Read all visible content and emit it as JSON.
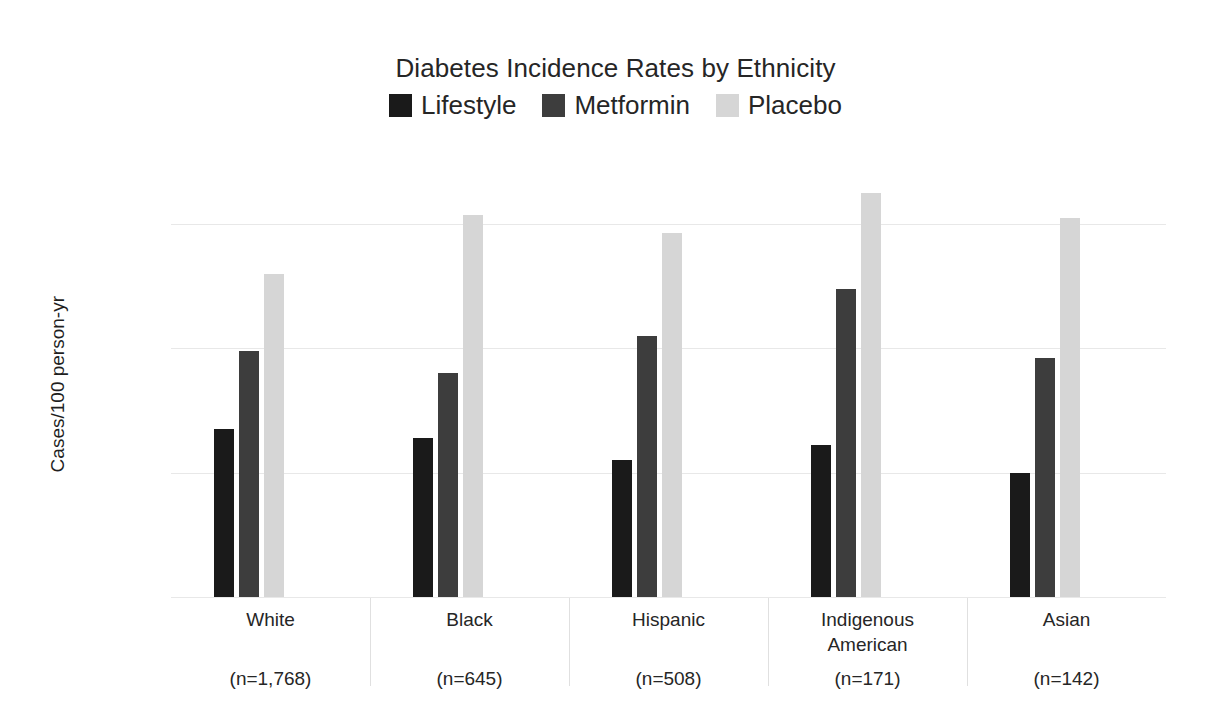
{
  "chart_data": {
    "type": "bar",
    "title": "Diabetes Incidence Rates by Ethnicity",
    "xlabel": "",
    "ylabel": "Cases/100 person-yr",
    "ylim": [
      0,
      13.6
    ],
    "yticks": [
      0,
      4,
      8,
      12
    ],
    "ytick_labels": [
      "0",
      "4",
      "8",
      "12"
    ],
    "grid": true,
    "legend_position": "top-center",
    "categories": [
      "White",
      "Black",
      "Hispanic",
      "Indigenous American",
      "Asian"
    ],
    "category_sublabels": [
      "(n=1,768)",
      "(n=645)",
      "(n=508)",
      "(n=171)",
      "(n=142)"
    ],
    "series": [
      {
        "name": "Lifestyle",
        "color": "#1a1a1a",
        "values": [
          5.4,
          5.1,
          4.4,
          4.9,
          4.0
        ]
      },
      {
        "name": "Metformin",
        "color": "#3d3d3d",
        "values": [
          7.9,
          7.2,
          8.4,
          9.9,
          7.7
        ]
      },
      {
        "name": "Placebo",
        "color": "#d6d6d6",
        "values": [
          10.4,
          12.3,
          11.7,
          13.0,
          12.2
        ]
      }
    ]
  },
  "colors": {
    "background": "#ffffff",
    "text": "#262626",
    "gridline": "#e8e8e8",
    "axis": "#cfcfcf"
  }
}
